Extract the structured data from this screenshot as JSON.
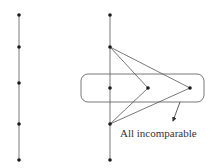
{
  "diagram": {
    "left_chain": {
      "x": 19,
      "nodes_y": [
        15,
        47,
        83,
        124,
        160
      ]
    },
    "right_poset": {
      "spine_x": 110,
      "spine_nodes_y": [
        15,
        47,
        88,
        124,
        160
      ],
      "antichain_nodes": [
        {
          "x": 110,
          "y": 88
        },
        {
          "x": 148,
          "y": 88
        },
        {
          "x": 190,
          "y": 88
        }
      ],
      "edges": [
        {
          "from": [
            110,
            47
          ],
          "to": [
            148,
            88
          ]
        },
        {
          "from": [
            110,
            47
          ],
          "to": [
            190,
            88
          ]
        },
        {
          "from": [
            148,
            88
          ],
          "to": [
            110,
            124
          ]
        },
        {
          "from": [
            190,
            88
          ],
          "to": [
            110,
            124
          ]
        }
      ],
      "antichain_box": {
        "x": 81,
        "y": 74,
        "width": 123,
        "height": 28,
        "rx": 7
      },
      "annotation": {
        "text": "All incomparable",
        "arrow_from": [
          180,
          102
        ],
        "arrow_to": [
          173,
          121
        ]
      }
    },
    "colors": {
      "line": "#444444",
      "node": "#1a1a1a",
      "text": "#333333"
    }
  }
}
